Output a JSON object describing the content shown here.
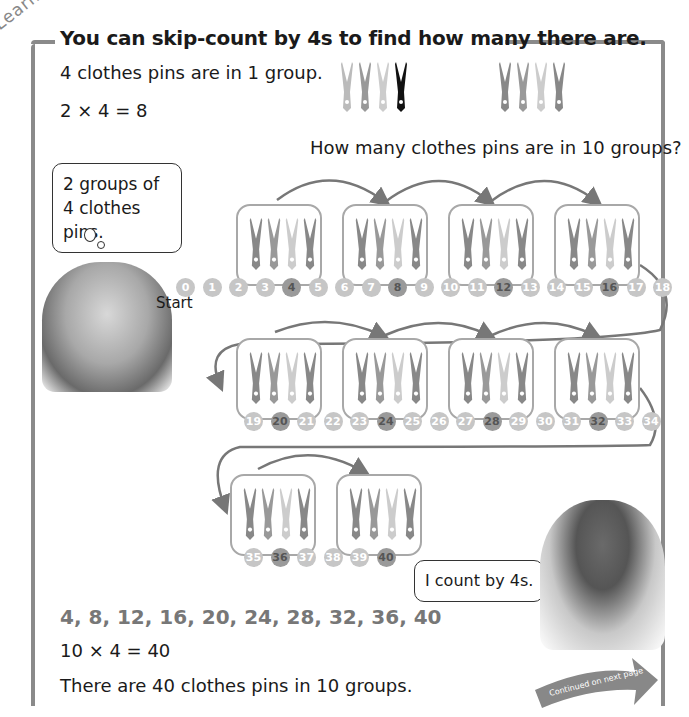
{
  "section_label": "Learn",
  "heading": "You can skip-count by 4s to find how many there are.",
  "intro": {
    "line1": "4 clothes pins are in 1 group.",
    "line2": "2 × 4 = 8"
  },
  "question": "How many clothes pins are in 10 groups?",
  "girl_thought": "2 groups of 4 clothes pins.",
  "start_label": "Start",
  "number_line": {
    "row1": [
      "0",
      "1",
      "2",
      "3",
      "4",
      "5",
      "6",
      "7",
      "8",
      "9",
      "10",
      "11",
      "12",
      "13",
      "14",
      "15",
      "16",
      "17",
      "18"
    ],
    "row2": [
      "19",
      "20",
      "21",
      "22",
      "23",
      "24",
      "25",
      "26",
      "27",
      "28",
      "29",
      "30",
      "31",
      "32",
      "33",
      "34"
    ],
    "row3": [
      "35",
      "36",
      "37",
      "38",
      "39",
      "40"
    ],
    "multiples": [
      "4",
      "8",
      "12",
      "16",
      "20",
      "24",
      "28",
      "32",
      "36",
      "40"
    ]
  },
  "groups_count": 10,
  "pins_per_group": 4,
  "sequence": "4, 8, 12, 16, 20, 24, 28, 32, 36, 40",
  "equation": "10 × 4 = 40",
  "conclusion": "There are 40 clothes pins in 10 groups.",
  "boy_speech": "I count by 4s.",
  "continued_label": "Continued on next page",
  "colors": {
    "frame": "#8a8a8a",
    "circle": "#c6c6c6",
    "circle_multiple": "#9a9a9a",
    "arrow": "#777777",
    "sequence_text": "#777777"
  }
}
